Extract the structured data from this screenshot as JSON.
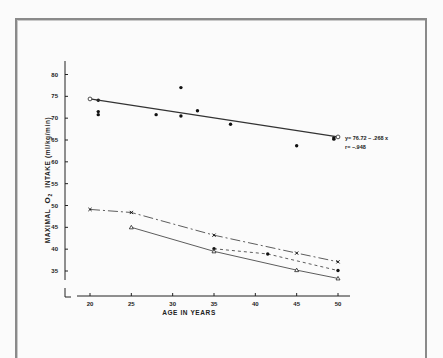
{
  "chart_data": {
    "type": "scatter",
    "title": "",
    "xlabel": "AGE IN YEARS",
    "ylabel": "MAXIMAL O2 INTAKE (ml/kg/min)",
    "xlim": [
      18,
      52
    ],
    "ylim": [
      33,
      82
    ],
    "x_ticks": [
      20,
      25,
      30,
      35,
      40,
      45,
      50
    ],
    "y_ticks": [
      35,
      40,
      45,
      50,
      55,
      60,
      65,
      70,
      75,
      80
    ],
    "grid": false,
    "series": [
      {
        "name": "Trained runners (individual points)",
        "marker": "filled-circle",
        "style": "points",
        "points": [
          [
            21,
            74.1
          ],
          [
            21,
            71.5
          ],
          [
            21,
            70.8
          ],
          [
            28,
            70.8
          ],
          [
            31,
            77.0
          ],
          [
            31,
            70.5
          ],
          [
            33,
            71.7
          ],
          [
            37,
            68.6
          ],
          [
            45,
            63.7
          ],
          [
            49.5,
            65.2
          ],
          [
            49.5,
            65.5
          ]
        ]
      },
      {
        "name": "Regression line",
        "marker": "open-circle",
        "style": "solid",
        "points": [
          [
            20,
            74.4
          ],
          [
            50,
            65.7
          ]
        ]
      },
      {
        "name": "Series X",
        "marker": "cross",
        "style": "dash-dot",
        "points": [
          [
            20,
            49.1
          ],
          [
            25,
            48.4
          ],
          [
            35,
            43.2
          ],
          [
            45,
            39.1
          ],
          [
            50,
            37.1
          ]
        ]
      },
      {
        "name": "Series dot",
        "marker": "filled-circle",
        "style": "dashed",
        "points": [
          [
            35,
            40.1
          ],
          [
            41.5,
            38.9
          ],
          [
            50,
            35.1
          ]
        ]
      },
      {
        "name": "Series triangle",
        "marker": "triangle",
        "style": "solid",
        "points": [
          [
            25,
            45.0
          ],
          [
            35,
            39.5
          ],
          [
            45,
            35.2
          ],
          [
            50,
            33.3
          ]
        ]
      }
    ],
    "annotations": [
      {
        "text": "y= 76.72 − .268 x",
        "x": 50.5,
        "y": 66
      },
      {
        "text": "r= −.948",
        "x": 50.5,
        "y": 64
      }
    ]
  },
  "labels": {
    "x_axis": "AGE IN YEARS",
    "y_axis_main": "MAXIMAL",
    "y_axis_o": "O",
    "y_axis_sub": "2",
    "y_axis_rest": "INTAKE (ml/kg/min)",
    "equation": "y= 76.72 − .268 x",
    "r_value": "r= −.948",
    "x_ticks": [
      "20",
      "25",
      "30",
      "35",
      "40",
      "45",
      "50"
    ],
    "y_ticks": [
      "80",
      "75",
      "70",
      "65",
      "60",
      "55",
      "50",
      "45",
      "40",
      "35"
    ]
  }
}
